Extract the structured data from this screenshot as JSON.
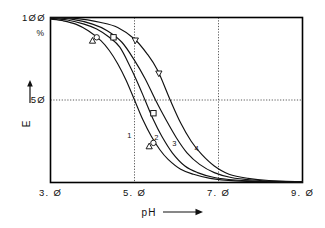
{
  "chart_data": {
    "type": "line",
    "title": "",
    "xlabel": "pH",
    "ylabel": "E",
    "yunit": "%",
    "xlim": [
      3.0,
      9.0
    ],
    "ylim": [
      0,
      100
    ],
    "grid": "dotted",
    "gridlines": {
      "x": [
        5.0,
        7.0
      ],
      "y": [
        50
      ]
    },
    "xticks": [
      "3. Ø",
      "5. Ø",
      "7. Ø",
      "9. Ø"
    ],
    "xtick_values": [
      3.0,
      5.0,
      7.0,
      9.0
    ],
    "yticks": [
      "1ØØ",
      "5Ø"
    ],
    "ytick_values": [
      100,
      50
    ],
    "legend": "none",
    "series": [
      {
        "name": "1",
        "label": "1",
        "marker": "triangle-up",
        "midpoint_ph": 5.0,
        "x": [
          3.0,
          3.3,
          3.6,
          3.9,
          4.2,
          4.4,
          4.6,
          4.8,
          5.0,
          5.2,
          5.4,
          5.6,
          5.8,
          6.1,
          6.4,
          6.8,
          7.4,
          8.2,
          9.0
        ],
        "y": [
          99,
          98,
          96,
          92,
          86,
          80,
          72,
          62,
          50,
          38,
          28,
          20,
          14,
          8,
          5,
          2.5,
          1,
          0.4,
          0.2
        ],
        "points": [
          {
            "x": 4.0,
            "y": 86
          },
          {
            "x": 5.35,
            "y": 22
          }
        ]
      },
      {
        "name": "2",
        "label": "2",
        "marker": "circle",
        "midpoint_ph": 5.25,
        "x": [
          3.0,
          3.4,
          3.8,
          4.1,
          4.4,
          4.65,
          4.9,
          5.1,
          5.25,
          5.45,
          5.65,
          5.9,
          6.2,
          6.5,
          6.9,
          7.4,
          8.1,
          9.0
        ],
        "y": [
          99.5,
          98.5,
          96,
          93,
          88,
          82,
          70,
          59,
          50,
          38,
          28,
          18,
          10,
          6,
          3,
          1.5,
          0.6,
          0.3
        ],
        "points": [
          {
            "x": 4.1,
            "y": 88
          },
          {
            "x": 5.45,
            "y": 24
          }
        ]
      },
      {
        "name": "3",
        "label": "3",
        "marker": "square",
        "midpoint_ph": 5.5,
        "x": [
          3.0,
          3.5,
          4.0,
          4.35,
          4.7,
          5.0,
          5.25,
          5.5,
          5.75,
          6.0,
          6.25,
          6.55,
          6.9,
          7.3,
          7.8,
          8.4,
          9.0
        ],
        "y": [
          100,
          99,
          96,
          92,
          85,
          74,
          63,
          50,
          38,
          27,
          18,
          11,
          6,
          3,
          1.5,
          0.7,
          0.4
        ],
        "points": [
          {
            "x": 4.5,
            "y": 88
          },
          {
            "x": 5.45,
            "y": 42
          }
        ]
      },
      {
        "name": "4",
        "label": "4",
        "marker": "triangle-down",
        "midpoint_ph": 5.85,
        "x": [
          3.0,
          3.6,
          4.2,
          4.6,
          5.0,
          5.3,
          5.55,
          5.85,
          6.1,
          6.35,
          6.6,
          6.9,
          7.25,
          7.7,
          8.2,
          9.0
        ],
        "y": [
          100,
          99.5,
          97,
          94,
          87,
          78,
          68,
          50,
          36,
          25,
          17,
          10,
          5,
          2.5,
          1.2,
          0.5
        ],
        "points": [
          {
            "x": 5.02,
            "y": 86
          },
          {
            "x": 5.58,
            "y": 66
          }
        ]
      }
    ]
  },
  "axis": {
    "x_title": "pH",
    "x_arrow": "→",
    "y_title": "E",
    "y_arrow": "↑",
    "y_unit": "%",
    "y_top_label": "1ØØ",
    "y_mid_label": "5Ø",
    "x_labels": [
      "3. Ø",
      "5. Ø",
      "7. Ø",
      "9. Ø"
    ]
  },
  "colors": {
    "ink": "#111111",
    "frame": "#000000",
    "grid": "#444444",
    "background": "#ffffff"
  }
}
